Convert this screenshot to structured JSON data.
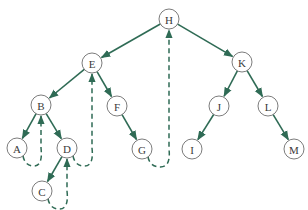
{
  "diagram": {
    "type": "threaded-binary-tree",
    "colors": {
      "edge": "#2f6b55",
      "node_stroke": "#5a5a5a",
      "node_fill": "#ffffff",
      "label": "#3a3a3a",
      "background": "#ffffff"
    },
    "nodes": [
      {
        "id": "H",
        "label": "H",
        "x": 169,
        "y": 19
      },
      {
        "id": "E",
        "label": "E",
        "x": 92,
        "y": 63
      },
      {
        "id": "K",
        "label": "K",
        "x": 242,
        "y": 62
      },
      {
        "id": "B",
        "label": "B",
        "x": 41,
        "y": 105
      },
      {
        "id": "F",
        "label": "F",
        "x": 117,
        "y": 106
      },
      {
        "id": "J",
        "label": "J",
        "x": 219,
        "y": 106
      },
      {
        "id": "L",
        "label": "L",
        "x": 268,
        "y": 106
      },
      {
        "id": "A",
        "label": "A",
        "x": 17,
        "y": 148
      },
      {
        "id": "D",
        "label": "D",
        "x": 67,
        "y": 148
      },
      {
        "id": "G",
        "label": "G",
        "x": 142,
        "y": 149
      },
      {
        "id": "I",
        "label": "I",
        "x": 192,
        "y": 149
      },
      {
        "id": "M",
        "label": "M",
        "x": 294,
        "y": 149
      },
      {
        "id": "C",
        "label": "C",
        "x": 42,
        "y": 191
      }
    ],
    "edges": [
      {
        "from": "H",
        "to": "E",
        "style": "solid"
      },
      {
        "from": "H",
        "to": "K",
        "style": "solid"
      },
      {
        "from": "E",
        "to": "B",
        "style": "solid"
      },
      {
        "from": "E",
        "to": "F",
        "style": "solid"
      },
      {
        "from": "B",
        "to": "A",
        "style": "solid"
      },
      {
        "from": "B",
        "to": "D",
        "style": "solid"
      },
      {
        "from": "D",
        "to": "C",
        "style": "solid"
      },
      {
        "from": "F",
        "to": "G",
        "style": "solid"
      },
      {
        "from": "K",
        "to": "J",
        "style": "solid"
      },
      {
        "from": "K",
        "to": "L",
        "style": "solid"
      },
      {
        "from": "J",
        "to": "I",
        "style": "solid"
      },
      {
        "from": "L",
        "to": "M",
        "style": "solid"
      }
    ],
    "threads": [
      {
        "from": "A",
        "to": "B",
        "style": "dashed"
      },
      {
        "from": "C",
        "to": "D",
        "style": "dashed"
      },
      {
        "from": "D",
        "to": "E",
        "style": "dashed"
      },
      {
        "from": "G",
        "to": "H",
        "style": "dashed"
      }
    ]
  }
}
